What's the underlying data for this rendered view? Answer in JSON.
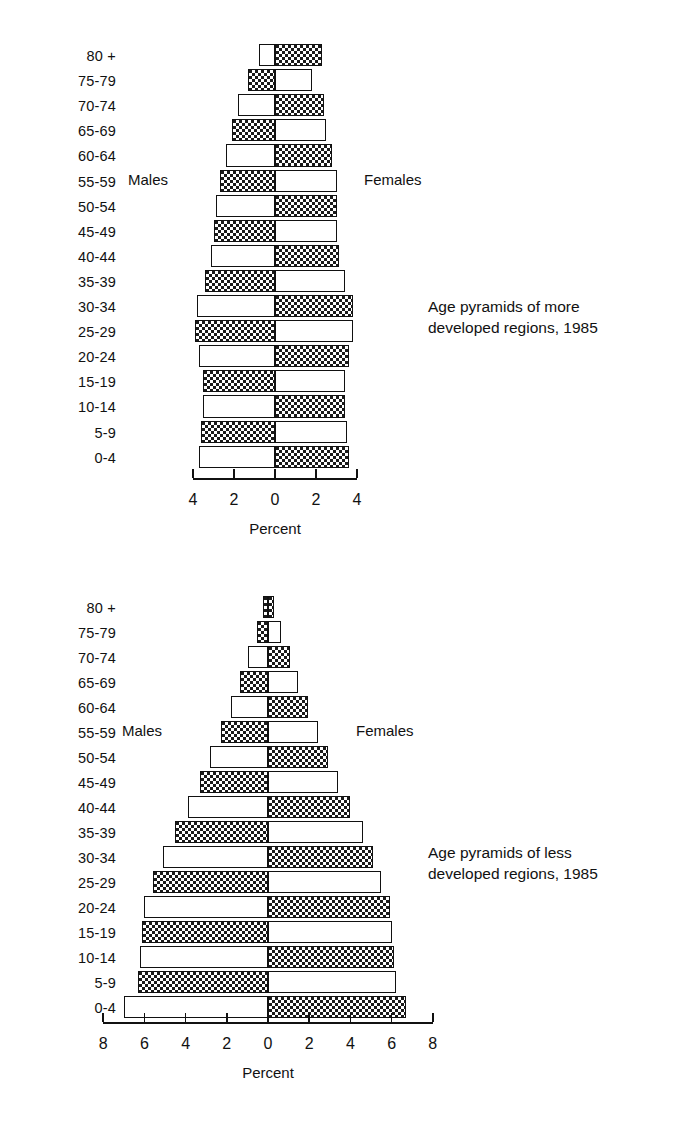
{
  "page": {
    "background": "#ffffff",
    "ink": "#111111"
  },
  "age_groups": [
    "80 +",
    "75-79",
    "70-74",
    "65-69",
    "60-64",
    "55-59",
    "50-54",
    "45-49",
    "40-44",
    "35-39",
    "30-34",
    "25-29",
    "20-24",
    "15-19",
    "10-14",
    "5-9",
    "0-4"
  ],
  "labels": {
    "males": "Males",
    "females": "Females",
    "percent": "Percent"
  },
  "charts": [
    {
      "id": "more-developed",
      "caption": "Age pyramids of more\ndeveloped regions, 1985",
      "axis": {
        "ticks": [
          "4",
          "2",
          "0",
          "2",
          "4"
        ],
        "max": 4,
        "step": 2,
        "title": "Percent"
      }
    },
    {
      "id": "less-developed",
      "caption": "Age pyramids of less\ndeveloped regions, 1985",
      "axis": {
        "ticks": [
          "8",
          "6",
          "4",
          "2",
          "0",
          "2",
          "4",
          "6",
          "8"
        ],
        "max": 8,
        "step": 2,
        "title": "Percent"
      }
    }
  ],
  "chart_data": [
    {
      "type": "bar",
      "id": "more-developed",
      "title": "Age pyramids of more developed regions, 1985",
      "subtitle": "",
      "orientation": "horizontal-diverging",
      "xlabel": "Percent",
      "ylabel": "",
      "xlim": [
        -4,
        4
      ],
      "xticks": [
        -4,
        -2,
        0,
        2,
        4
      ],
      "xticklabels": [
        "4",
        "2",
        "0",
        "2",
        "4"
      ],
      "grid": false,
      "legend_position": "inline-sides",
      "categories": [
        "80 +",
        "75-79",
        "70-74",
        "65-69",
        "60-64",
        "55-59",
        "50-54",
        "45-49",
        "40-44",
        "35-39",
        "30-34",
        "25-29",
        "20-24",
        "15-19",
        "10-14",
        "5-9",
        "0-4"
      ],
      "series": [
        {
          "name": "Males",
          "side": "left",
          "fills": [
            "plain",
            "dots",
            "plain",
            "dots",
            "plain",
            "dots",
            "plain",
            "dots",
            "plain",
            "dots",
            "plain",
            "dots",
            "plain",
            "dots",
            "plain",
            "dots",
            "plain"
          ],
          "values": [
            0.8,
            1.3,
            1.8,
            2.1,
            2.4,
            2.7,
            2.9,
            3.0,
            3.1,
            3.4,
            3.8,
            3.9,
            3.7,
            3.5,
            3.5,
            3.6,
            3.7
          ]
        },
        {
          "name": "Females",
          "side": "right",
          "fills": [
            "dots",
            "plain",
            "dots",
            "plain",
            "dots",
            "plain",
            "dots",
            "plain",
            "dots",
            "plain",
            "dots",
            "plain",
            "dots",
            "plain",
            "dots",
            "plain",
            "dots"
          ],
          "values": [
            2.3,
            1.8,
            2.4,
            2.5,
            2.8,
            3.0,
            3.0,
            3.0,
            3.1,
            3.4,
            3.8,
            3.8,
            3.6,
            3.4,
            3.4,
            3.5,
            3.6
          ]
        }
      ]
    },
    {
      "type": "bar",
      "id": "less-developed",
      "title": "Age pyramids of less developed regions, 1985",
      "subtitle": "",
      "orientation": "horizontal-diverging",
      "xlabel": "Percent",
      "ylabel": "",
      "xlim": [
        -8,
        8
      ],
      "xticks": [
        -8,
        -6,
        -4,
        -2,
        0,
        2,
        4,
        6,
        8
      ],
      "xticklabels": [
        "8",
        "6",
        "4",
        "2",
        "0",
        "2",
        "4",
        "6",
        "8"
      ],
      "grid": false,
      "legend_position": "inline-sides",
      "categories": [
        "80 +",
        "75-79",
        "70-74",
        "65-69",
        "60-64",
        "55-59",
        "50-54",
        "45-49",
        "40-44",
        "35-39",
        "30-34",
        "25-29",
        "20-24",
        "15-19",
        "10-14",
        "5-9",
        "0-4"
      ],
      "series": [
        {
          "name": "Males",
          "side": "left",
          "fills": [
            "dots",
            "dots",
            "plain",
            "dots",
            "plain",
            "dots",
            "plain",
            "dots",
            "plain",
            "dots",
            "plain",
            "dots",
            "plain",
            "dots",
            "plain",
            "dots",
            "plain"
          ],
          "values": [
            0.25,
            0.55,
            0.95,
            1.35,
            1.8,
            2.3,
            2.8,
            3.3,
            3.9,
            4.5,
            5.1,
            5.6,
            6.0,
            6.1,
            6.2,
            6.3,
            7.0
          ]
        },
        {
          "name": "Females",
          "side": "right",
          "fills": [
            "dots",
            "plain",
            "dots",
            "plain",
            "dots",
            "plain",
            "dots",
            "plain",
            "dots",
            "plain",
            "dots",
            "plain",
            "dots",
            "plain",
            "dots",
            "plain",
            "dots"
          ],
          "values": [
            0.3,
            0.65,
            1.05,
            1.45,
            1.95,
            2.45,
            2.9,
            3.4,
            4.0,
            4.6,
            5.1,
            5.5,
            5.9,
            6.0,
            6.1,
            6.2,
            6.7
          ]
        }
      ]
    }
  ]
}
